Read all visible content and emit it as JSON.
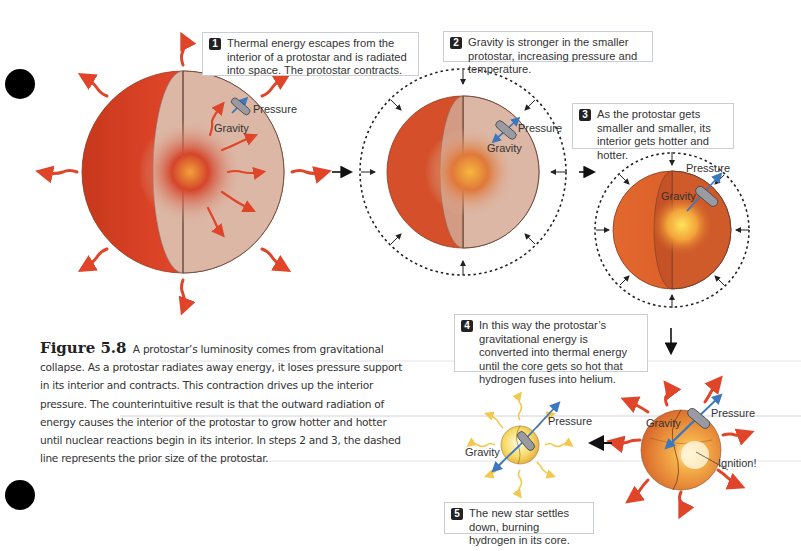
{
  "figure": {
    "number": "Figure 5.8",
    "caption": "A protostar’s luminosity comes from gravitational collapse. As a protostar radiates away energy, it loses pressure support in its interior and contracts. This contraction drives up the interior pressure. The counterintuitive result is that the outward radiation of energy causes the interior of the protostar to grow hotter and hotter until nuclear reactions begin in its interior. In steps 2 and 3, the dashed line represents the prior size of the protostar."
  },
  "steps": [
    {
      "num": "1",
      "text": "Thermal energy escapes from the interior of a protostar and is radiated into space. The protostar contracts."
    },
    {
      "num": "2",
      "text": "Gravity is stronger in the smaller protostar, increasing pressure and temperature."
    },
    {
      "num": "3",
      "text": "As the protostar gets smaller and smaller, its interior gets hotter and hotter."
    },
    {
      "num": "4",
      "text": "In this way the protostar’s gravitational energy is converted into thermal energy until the core gets so hot that hydrogen fuses into helium."
    },
    {
      "num": "5",
      "text": "The new star settles down, burning hydrogen in its core."
    }
  ],
  "labels": {
    "pressure": "Pressure",
    "gravity": "Gravity",
    "ignition": "Ignition!"
  },
  "colors": {
    "radiation_arrow": "#e0452a",
    "star_outer": "#d2401c",
    "cutaway": "#dcb7a5",
    "force_arrow": "#3a78c0",
    "new_star_rays": "#f2c94c",
    "callout_border": "#c8ced3"
  }
}
